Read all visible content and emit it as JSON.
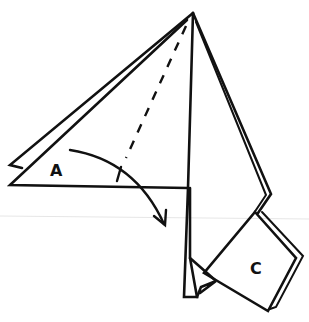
{
  "diagram": {
    "type": "origami-fold-step",
    "labels": {
      "flap_a": "A",
      "flap_c": "C"
    },
    "instructions": {
      "fold": "valley-fold flap A along dashed line toward the right, as shown by arrow"
    },
    "colors": {
      "line": "#111111",
      "background": "#ffffff"
    }
  }
}
